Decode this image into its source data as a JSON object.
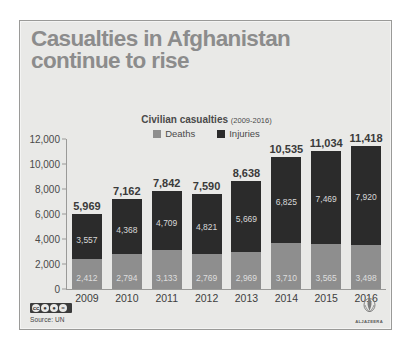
{
  "title": {
    "line1": "Casualties in Afghanistan",
    "line2": "continue to rise"
  },
  "subtitle": {
    "main": "Civilian casualties",
    "range": "(2009-2016)"
  },
  "legend": [
    {
      "label": "Deaths",
      "color": "#8e8e8e",
      "icon": "square-swatch-icon"
    },
    {
      "label": "Injuries",
      "color": "#2b2b2b",
      "icon": "square-swatch-icon"
    }
  ],
  "footer": {
    "source": "Source: UN",
    "cc_license": "creative-commons-badge",
    "brand": "ALJAZEERA"
  },
  "colors": {
    "deaths": "#8e8e8e",
    "injuries": "#2b2b2b",
    "panel_background": "#e9e9e7",
    "title_text": "#8c8c8c",
    "axis": "#9a9a98"
  },
  "chart_data": {
    "type": "bar",
    "stacked": true,
    "title": "Civilian casualties (2009-2016)",
    "xlabel": "",
    "ylabel": "",
    "ylim": [
      0,
      12000
    ],
    "yticks": [
      0,
      2000,
      4000,
      6000,
      8000,
      10000,
      12000
    ],
    "ytick_labels": [
      "0",
      "2,000",
      "4,000",
      "6,000",
      "8,000",
      "10,000",
      "12,000"
    ],
    "grid": false,
    "legend_position": "top-center",
    "categories": [
      "2009",
      "2010",
      "2011",
      "2012",
      "2013",
      "2014",
      "2015",
      "2016"
    ],
    "series": [
      {
        "name": "Deaths",
        "color": "#8e8e8e",
        "values": [
          2412,
          2794,
          3133,
          2769,
          2969,
          3710,
          3565,
          3498
        ],
        "labels": [
          "2,412",
          "2,794",
          "3,133",
          "2,769",
          "2,969",
          "3,710",
          "3,565",
          "3,498"
        ]
      },
      {
        "name": "Injuries",
        "color": "#2b2b2b",
        "values": [
          3557,
          4368,
          4709,
          4821,
          5669,
          6825,
          7469,
          7920
        ],
        "labels": [
          "3,557",
          "4,368",
          "4,709",
          "4,821",
          "5,669",
          "6,825",
          "7,469",
          "7,920"
        ]
      }
    ],
    "totals": [
      5969,
      7162,
      7842,
      7590,
      8638,
      10535,
      11034,
      11418
    ],
    "total_labels": [
      "5,969",
      "7,162",
      "7,842",
      "7,590",
      "8,638",
      "10,535",
      "11,034",
      "11,418"
    ]
  }
}
